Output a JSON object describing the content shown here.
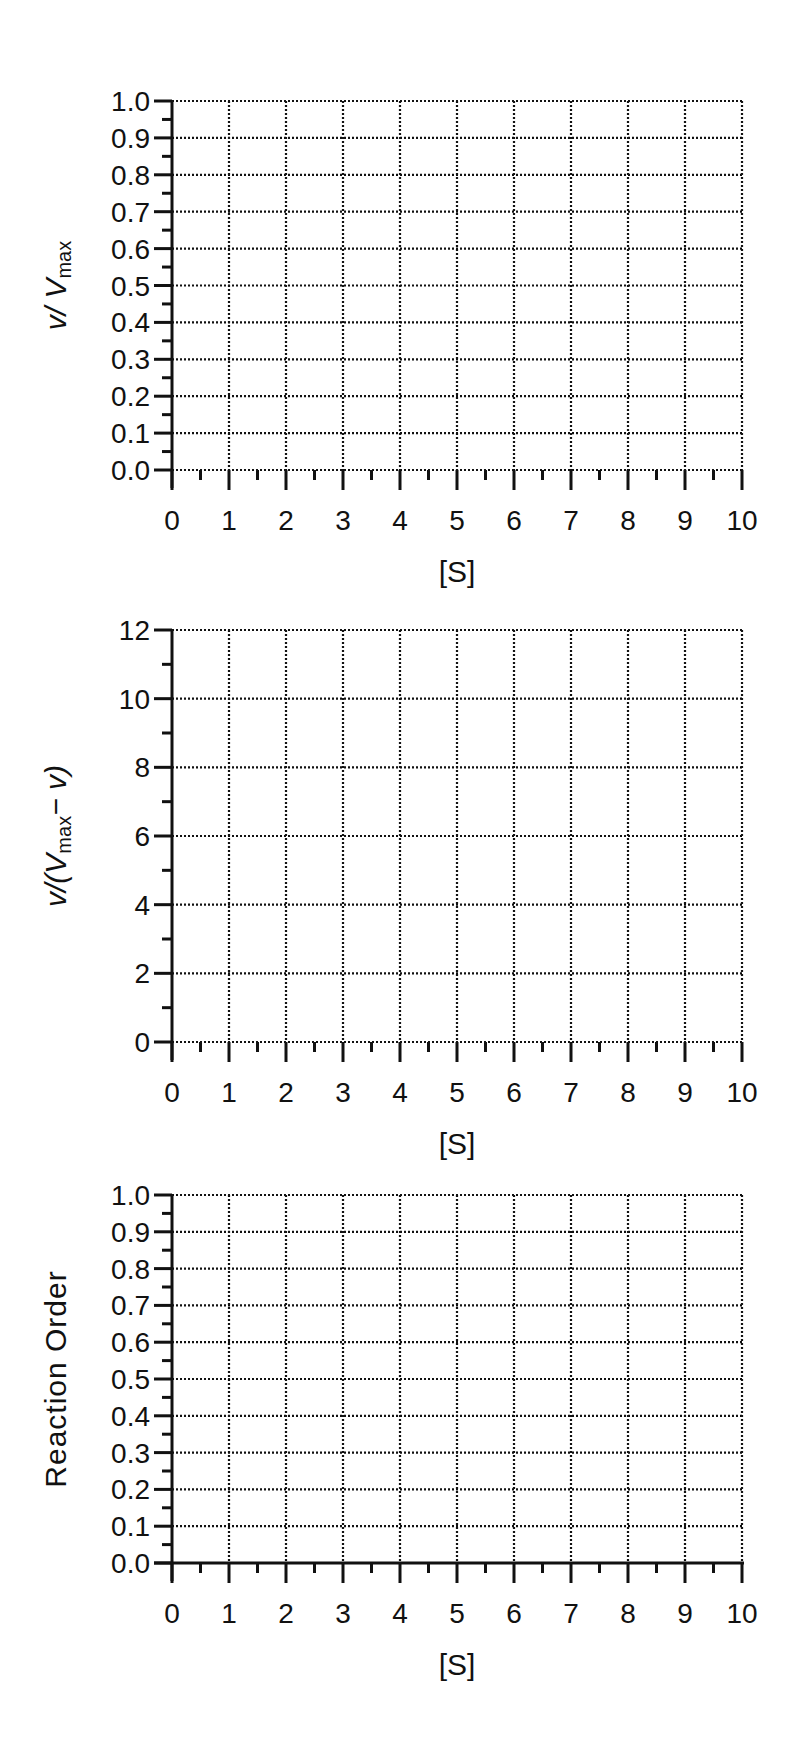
{
  "chart_data": [
    {
      "type": "line",
      "title": "",
      "xlabel": "[S]",
      "ylabel": "v/ Vmax",
      "ylabel_parts": {
        "main": "v/ V",
        "sub": "max",
        "tail": ""
      },
      "xlim": [
        0,
        10
      ],
      "ylim": [
        0,
        1.0
      ],
      "x_ticks": [
        "0",
        "1",
        "2",
        "3",
        "4",
        "5",
        "6",
        "7",
        "8",
        "9",
        "10"
      ],
      "y_ticks": [
        "0.0",
        "0.1",
        "0.2",
        "0.3",
        "0.4",
        "0.5",
        "0.6",
        "0.7",
        "0.8",
        "0.9",
        "1.0"
      ],
      "y_values": [
        0,
        0.1,
        0.2,
        0.3,
        0.4,
        0.5,
        0.6,
        0.7,
        0.8,
        0.9,
        1.0
      ],
      "y_minor": true,
      "x_minor": true,
      "grid": "dotted",
      "dotted_baseline": true,
      "series": []
    },
    {
      "type": "line",
      "title": "",
      "xlabel": "[S]",
      "ylabel": "v/(Vmax− v)",
      "ylabel_parts": {
        "main": "v/(V",
        "sub": "max",
        "tail": "− v)"
      },
      "xlim": [
        0,
        10
      ],
      "ylim": [
        0,
        12
      ],
      "x_ticks": [
        "0",
        "1",
        "2",
        "3",
        "4",
        "5",
        "6",
        "7",
        "8",
        "9",
        "10"
      ],
      "y_ticks": [
        "0",
        "2",
        "4",
        "6",
        "8",
        "10",
        "12"
      ],
      "y_values": [
        0,
        2,
        4,
        6,
        8,
        10,
        12
      ],
      "y_minor": true,
      "x_minor": true,
      "grid": "dotted",
      "dotted_baseline": true,
      "series": []
    },
    {
      "type": "line",
      "title": "",
      "xlabel": "[S]",
      "ylabel": "Reaction Order",
      "ylabel_parts": {
        "main": "Reaction Order",
        "sub": "",
        "tail": ""
      },
      "xlim": [
        0,
        10
      ],
      "ylim": [
        0,
        1.0
      ],
      "x_ticks": [
        "0",
        "1",
        "2",
        "3",
        "4",
        "5",
        "6",
        "7",
        "8",
        "9",
        "10"
      ],
      "y_ticks": [
        "0.0",
        "0.1",
        "0.2",
        "0.3",
        "0.4",
        "0.5",
        "0.6",
        "0.7",
        "0.8",
        "0.9",
        "1.0"
      ],
      "y_values": [
        0,
        0.1,
        0.2,
        0.3,
        0.4,
        0.5,
        0.6,
        0.7,
        0.8,
        0.9,
        1.0
      ],
      "y_minor": true,
      "x_minor": true,
      "grid": "dotted",
      "dotted_baseline": false,
      "series": []
    }
  ],
  "layout": [
    {
      "top": 0,
      "y_top": 101,
      "y_bottom": 470
    },
    {
      "top": 0,
      "y_top": 630,
      "y_bottom": 1042
    },
    {
      "top": 0,
      "y_top": 1195,
      "y_bottom": 1563
    }
  ],
  "colors": {
    "ink": "#111111",
    "background": "#ffffff"
  }
}
